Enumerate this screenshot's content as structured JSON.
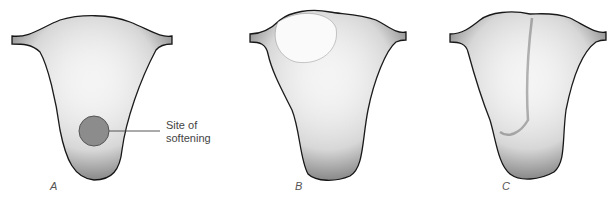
{
  "figure": {
    "panels": [
      {
        "id": "A",
        "label": "A"
      },
      {
        "id": "B",
        "label": "B"
      },
      {
        "id": "C",
        "label": "C"
      }
    ],
    "annotation": {
      "line1": "Site of",
      "line2": "softening"
    },
    "colors": {
      "outline": "#1a1a1a",
      "stipple": "#2a2a2a",
      "marker_fill": "#8c8c8c",
      "marker_stroke": "#555555",
      "text": "#444444"
    }
  }
}
